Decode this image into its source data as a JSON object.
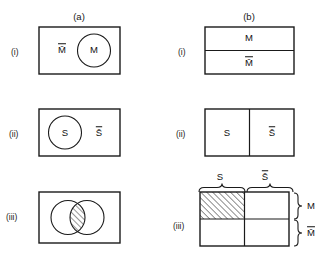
{
  "figure": {
    "columns": [
      {
        "id": "a",
        "label": "(a)",
        "caption": "Venn diagrams"
      },
      {
        "id": "b",
        "label": "(b)",
        "caption": "Map (Karnaugh) representations"
      }
    ],
    "rows": [
      {
        "id": "i",
        "label": "(i)"
      },
      {
        "id": "ii",
        "label": "(ii)"
      },
      {
        "id": "iii",
        "label": "(iii)"
      }
    ],
    "line_color": "#1a1a1a",
    "fill_color": "#ffffff",
    "hatch_color": "#1a1a1a"
  },
  "panel_a_i": {
    "name": "venn-M",
    "universe_label": "M̄",
    "set_label": "M"
  },
  "panel_a_ii": {
    "name": "venn-S",
    "set_label": "S",
    "complement_label": "S̄"
  },
  "panel_a_iii": {
    "name": "venn-intersection",
    "left_set_label": "",
    "right_set_label": "",
    "hatched_region": "intersection"
  },
  "panel_b_i": {
    "name": "map-M",
    "top_cell": "M",
    "bottom_cell": "M̄"
  },
  "panel_b_ii": {
    "name": "map-S",
    "left_cell": "S",
    "right_cell": "S̄"
  },
  "panel_b_iii": {
    "name": "map-MS",
    "top_brace_left": "S",
    "top_brace_right": "S̄",
    "right_brace_top": "M",
    "right_brace_bottom": "M̄",
    "hatched_cell": "top-left"
  }
}
